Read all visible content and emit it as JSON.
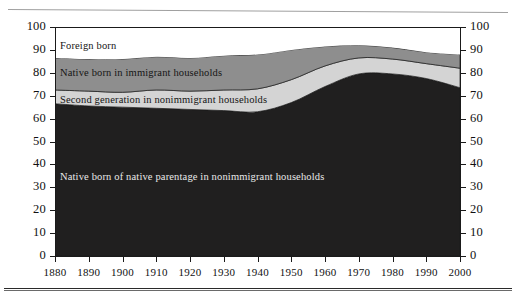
{
  "chart_data": {
    "type": "area",
    "stacked": true,
    "title": "",
    "subtitle": "",
    "xlabel": "",
    "ylabel": "",
    "xlim": [
      1880,
      2000
    ],
    "ylim": [
      0,
      100
    ],
    "grid": false,
    "legend_position": "inline-on-bands",
    "x": [
      1880,
      1890,
      1900,
      1910,
      1920,
      1930,
      1940,
      1950,
      1960,
      1970,
      1980,
      1990,
      2000
    ],
    "x_tick_labels": [
      "1880",
      "1890",
      "1900",
      "1910",
      "1920",
      "1930",
      "1940",
      "1950",
      "1960",
      "1970",
      "1980",
      "1990",
      "2000"
    ],
    "y_tick_labels_left": [
      "100",
      "90",
      "80",
      "70",
      "60",
      "50",
      "40",
      "30",
      "20",
      "10",
      "0"
    ],
    "y_tick_labels_right": [
      "100",
      "90",
      "80",
      "70",
      "60",
      "50",
      "40",
      "30",
      "20",
      "10",
      "0"
    ],
    "y_ticks": [
      0,
      10,
      20,
      30,
      40,
      50,
      60,
      70,
      80,
      90,
      100
    ],
    "series": [
      {
        "name": "Native born of native parentage in nonimmigrant households",
        "color": "#201f1f",
        "label_color": "#e9e9e9",
        "cumulative_top": [
          66.5,
          65.5,
          65.0,
          64.5,
          64.0,
          63.5,
          63.0,
          67.0,
          74.0,
          79.5,
          79.5,
          77.5,
          73.5
        ],
        "values": [
          66.5,
          65.5,
          65.0,
          64.5,
          64.0,
          63.5,
          63.0,
          67.0,
          74.0,
          79.5,
          79.5,
          77.5,
          73.5
        ]
      },
      {
        "name": "Second generation in nonimmigrant households",
        "color": "#d4d4d4",
        "label_color": "#151515",
        "cumulative_top": [
          72.5,
          72.0,
          71.5,
          72.5,
          72.0,
          72.5,
          73.0,
          77.0,
          83.0,
          86.5,
          86.0,
          84.0,
          82.0
        ],
        "values": [
          6.0,
          6.5,
          6.5,
          8.0,
          8.0,
          9.0,
          10.0,
          10.0,
          9.0,
          7.0,
          6.5,
          6.5,
          8.5
        ]
      },
      {
        "name": "Native born in immigrant households",
        "color": "#8e8e8e",
        "label_color": "#151515",
        "cumulative_top": [
          86.5,
          86.0,
          86.0,
          87.0,
          86.5,
          87.5,
          88.0,
          90.0,
          91.5,
          92.0,
          91.0,
          89.0,
          88.0
        ],
        "values": [
          14.0,
          14.0,
          14.5,
          14.5,
          14.5,
          15.0,
          15.0,
          13.0,
          8.5,
          5.5,
          5.0,
          5.0,
          6.0
        ]
      },
      {
        "name": "Foreign born",
        "color": "#ffffff",
        "label_color": "#151515",
        "cumulative_top": [
          100,
          100,
          100,
          100,
          100,
          100,
          100,
          100,
          100,
          100,
          100,
          100,
          100
        ],
        "values": [
          13.5,
          14.0,
          14.0,
          13.0,
          13.5,
          12.5,
          12.0,
          10.0,
          8.5,
          8.0,
          9.0,
          11.0,
          12.0
        ]
      }
    ],
    "band_labels": [
      {
        "text": "Foreign born",
        "x_px": 60,
        "y_px": 41,
        "tone": "dark"
      },
      {
        "text": "Native born in immigrant households",
        "x_px": 60,
        "y_px": 68,
        "tone": "dark"
      },
      {
        "text": "Second generation in nonimmigrant households",
        "x_px": 60,
        "y_px": 95,
        "tone": "dark"
      },
      {
        "text": "Native born of native parentage in nonimmigrant households",
        "x_px": 60,
        "y_px": 172,
        "tone": "light"
      }
    ]
  }
}
